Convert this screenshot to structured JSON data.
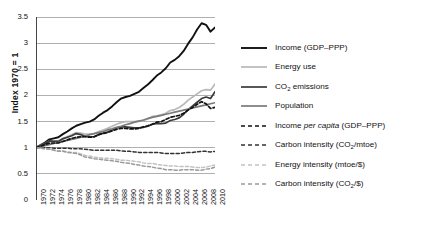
{
  "axis": {
    "ylabel": "Index 1970 = 1",
    "yticks": [
      "0",
      "0.5",
      "1",
      "1.5",
      "2",
      "2.5",
      "3",
      "3.5"
    ],
    "xticks": [
      "1970",
      "1972",
      "1974",
      "1976",
      "1978",
      "1980",
      "1982",
      "1984",
      "1986",
      "1988",
      "1990",
      "1992",
      "1994",
      "1996",
      "1998",
      "2000",
      "2002",
      "2004",
      "2006",
      "2008",
      "2010"
    ]
  },
  "legend": [
    {
      "label": "Income (GDP–PPP)",
      "color": "#111111",
      "dash": "solid",
      "width": 1.9,
      "name": "legend-item-income"
    },
    {
      "label": "Energy use",
      "color": "#b9b9b9",
      "dash": "solid",
      "width": 1.7,
      "name": "legend-item-energy-use"
    },
    {
      "label": "CO2 emissions",
      "color": "#3a3a3a",
      "dash": "solid",
      "width": 1.7,
      "name": "legend-item-co2-emissions"
    },
    {
      "label": "Population",
      "color": "#7a7a7a",
      "dash": "solid",
      "width": 1.7,
      "name": "legend-item-population"
    },
    {
      "label": "Income per capita (GDP–PPP)",
      "color": "#111111",
      "dash": "dashed",
      "width": 1.7,
      "name": "legend-item-income-per-capita"
    },
    {
      "label": "Carbon intensity (CO2/mtoe)",
      "color": "#333333",
      "dash": "dashed",
      "width": 1.5,
      "name": "legend-item-carbon-intensity-mtoe"
    },
    {
      "label": "Energy intensity (mtoe/$)",
      "color": "#c2c2c2",
      "dash": "dashed",
      "width": 1.5,
      "name": "legend-item-energy-intensity"
    },
    {
      "label": "Carbon intensity (CO2/$)",
      "color": "#9a9a9a",
      "dash": "dashed",
      "width": 1.5,
      "name": "legend-item-carbon-intensity-dollar"
    }
  ],
  "chart_data": {
    "type": "line",
    "title": "",
    "xlabel": "",
    "ylabel": "Index 1970 = 1",
    "xlim": [
      1970,
      2010
    ],
    "ylim": [
      0,
      3.5
    ],
    "grid": "horizontal",
    "legend_position": "right",
    "x": [
      1970,
      1971,
      1972,
      1973,
      1974,
      1975,
      1976,
      1977,
      1978,
      1979,
      1980,
      1981,
      1982,
      1983,
      1984,
      1985,
      1986,
      1987,
      1988,
      1989,
      1990,
      1991,
      1992,
      1993,
      1994,
      1995,
      1996,
      1997,
      1998,
      1999,
      2000,
      2001,
      2002,
      2003,
      2004,
      2005,
      2006,
      2007,
      2008,
      2009,
      2010
    ],
    "series": [
      {
        "name": "Income (GDP-PPP)",
        "color": "#111111",
        "dash": "solid",
        "values": [
          1.0,
          1.05,
          1.1,
          1.16,
          1.18,
          1.2,
          1.26,
          1.31,
          1.37,
          1.42,
          1.45,
          1.48,
          1.5,
          1.54,
          1.61,
          1.67,
          1.72,
          1.79,
          1.87,
          1.94,
          1.97,
          1.99,
          2.03,
          2.07,
          2.14,
          2.21,
          2.29,
          2.38,
          2.44,
          2.52,
          2.63,
          2.68,
          2.75,
          2.85,
          2.99,
          3.11,
          3.26,
          3.38,
          3.35,
          3.22,
          3.3
        ]
      },
      {
        "name": "Energy use",
        "color": "#b9b9b9",
        "dash": "solid",
        "values": [
          1.0,
          1.04,
          1.08,
          1.13,
          1.13,
          1.13,
          1.18,
          1.21,
          1.25,
          1.29,
          1.28,
          1.26,
          1.26,
          1.27,
          1.31,
          1.34,
          1.37,
          1.41,
          1.45,
          1.48,
          1.5,
          1.5,
          1.5,
          1.51,
          1.52,
          1.55,
          1.6,
          1.61,
          1.63,
          1.66,
          1.71,
          1.73,
          1.77,
          1.83,
          1.91,
          1.97,
          2.03,
          2.09,
          2.11,
          2.1,
          2.22
        ]
      },
      {
        "name": "CO2 emissions",
        "color": "#3a3a3a",
        "dash": "solid",
        "values": [
          1.0,
          1.04,
          1.08,
          1.13,
          1.12,
          1.12,
          1.17,
          1.2,
          1.23,
          1.27,
          1.25,
          1.22,
          1.21,
          1.21,
          1.25,
          1.28,
          1.3,
          1.34,
          1.38,
          1.4,
          1.4,
          1.39,
          1.38,
          1.38,
          1.39,
          1.41,
          1.45,
          1.46,
          1.46,
          1.47,
          1.52,
          1.54,
          1.57,
          1.64,
          1.73,
          1.8,
          1.87,
          1.94,
          1.97,
          1.94,
          2.07
        ]
      },
      {
        "name": "Population",
        "color": "#7a7a7a",
        "dash": "solid",
        "values": [
          1.0,
          1.02,
          1.04,
          1.06,
          1.08,
          1.1,
          1.12,
          1.14,
          1.16,
          1.18,
          1.2,
          1.22,
          1.25,
          1.27,
          1.29,
          1.31,
          1.34,
          1.36,
          1.39,
          1.41,
          1.44,
          1.46,
          1.49,
          1.51,
          1.53,
          1.56,
          1.58,
          1.6,
          1.62,
          1.64,
          1.66,
          1.68,
          1.7,
          1.72,
          1.74,
          1.76,
          1.78,
          1.8,
          1.82,
          1.84,
          1.86
        ]
      },
      {
        "name": "Income per capita (GDP-PPP)",
        "color": "#111111",
        "dash": "dashed",
        "values": [
          1.0,
          1.03,
          1.06,
          1.09,
          1.09,
          1.09,
          1.12,
          1.15,
          1.18,
          1.2,
          1.21,
          1.21,
          1.2,
          1.21,
          1.25,
          1.27,
          1.29,
          1.32,
          1.35,
          1.37,
          1.37,
          1.36,
          1.36,
          1.37,
          1.4,
          1.42,
          1.45,
          1.49,
          1.5,
          1.54,
          1.58,
          1.6,
          1.62,
          1.66,
          1.72,
          1.77,
          1.83,
          1.88,
          1.84,
          1.75,
          1.77
        ]
      },
      {
        "name": "Carbon intensity (CO2/mtoe)",
        "color": "#333333",
        "dash": "dashed",
        "values": [
          1.0,
          1.0,
          1.0,
          1.0,
          0.99,
          0.99,
          0.99,
          0.99,
          0.98,
          0.98,
          0.98,
          0.97,
          0.96,
          0.95,
          0.95,
          0.95,
          0.95,
          0.95,
          0.95,
          0.94,
          0.93,
          0.93,
          0.92,
          0.91,
          0.91,
          0.91,
          0.91,
          0.91,
          0.9,
          0.89,
          0.89,
          0.89,
          0.89,
          0.9,
          0.91,
          0.91,
          0.92,
          0.93,
          0.93,
          0.92,
          0.93
        ]
      },
      {
        "name": "Energy intensity (mtoe/$)",
        "color": "#c2c2c2",
        "dash": "dashed",
        "values": [
          1.0,
          0.99,
          0.98,
          0.97,
          0.96,
          0.94,
          0.94,
          0.92,
          0.91,
          0.91,
          0.88,
          0.85,
          0.84,
          0.82,
          0.81,
          0.8,
          0.8,
          0.79,
          0.78,
          0.76,
          0.76,
          0.75,
          0.74,
          0.73,
          0.71,
          0.7,
          0.7,
          0.68,
          0.67,
          0.66,
          0.65,
          0.65,
          0.64,
          0.64,
          0.64,
          0.63,
          0.62,
          0.62,
          0.63,
          0.65,
          0.67
        ]
      },
      {
        "name": "Carbon intensity (CO2/$)",
        "color": "#9a9a9a",
        "dash": "dashed",
        "values": [
          1.0,
          0.99,
          0.98,
          0.97,
          0.95,
          0.93,
          0.93,
          0.91,
          0.9,
          0.89,
          0.86,
          0.82,
          0.81,
          0.79,
          0.78,
          0.77,
          0.76,
          0.75,
          0.74,
          0.72,
          0.71,
          0.7,
          0.68,
          0.67,
          0.65,
          0.64,
          0.63,
          0.61,
          0.6,
          0.58,
          0.58,
          0.57,
          0.57,
          0.58,
          0.58,
          0.58,
          0.57,
          0.57,
          0.59,
          0.6,
          0.63
        ]
      }
    ]
  }
}
